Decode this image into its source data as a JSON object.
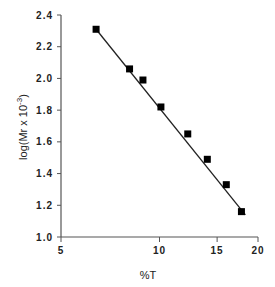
{
  "chart_data": {
    "type": "scatter",
    "title": "",
    "xlabel": "%T",
    "ylabel": "log(Mr x 10^-3)",
    "ylabel_display": {
      "main": "log(Mr  x  10",
      "sup": "-3",
      "tail": ")"
    },
    "xscale": "log",
    "xlim": [
      5,
      20
    ],
    "ylim": [
      1.0,
      2.4
    ],
    "xticks": [
      5,
      10,
      15,
      20
    ],
    "xtick_labels": [
      "5",
      "10",
      "15",
      "20"
    ],
    "yticks": [
      1.0,
      1.2,
      1.4,
      1.6,
      1.8,
      2.0,
      2.2,
      2.4
    ],
    "ytick_labels": [
      "1.0",
      "1.2",
      "1.4",
      "1.6",
      "1.8",
      "2.0",
      "2.2",
      "2.4"
    ],
    "grid": false,
    "legend": null,
    "marker": "square",
    "series": [
      {
        "name": "data",
        "x": [
          6.4,
          8.1,
          8.9,
          10.1,
          12.2,
          14.0,
          16.0,
          17.8
        ],
        "y": [
          2.31,
          2.06,
          1.99,
          1.82,
          1.65,
          1.49,
          1.33,
          1.16
        ]
      }
    ],
    "fit_line": {
      "x": [
        6.4,
        18.3
      ],
      "y": [
        2.31,
        1.14
      ]
    },
    "colors": {
      "marker": "#000000",
      "line": "#222222",
      "axis": "#555555"
    }
  }
}
